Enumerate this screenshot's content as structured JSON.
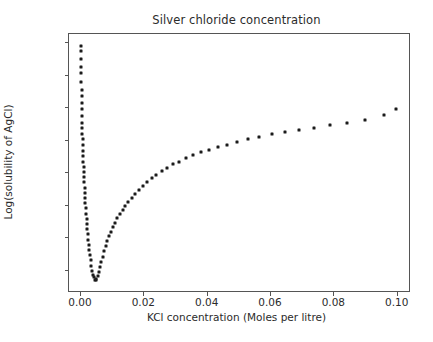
{
  "chart_data": {
    "type": "scatter",
    "title": "Silver chloride concentration",
    "xlabel": "KCl concentration (Moles per litre)",
    "ylabel": "Log(solubility of AgCl)",
    "xlim": [
      -0.0038,
      0.1042
    ],
    "ylim": [
      -6.92,
      -4.93
    ],
    "grid": false,
    "legend": null,
    "marker": {
      "shape": "square-dot",
      "size_px": 3,
      "color": "#1b1b1b"
    },
    "xticks": [
      0.0,
      0.02,
      0.04,
      0.06,
      0.08,
      0.1
    ],
    "xtick_labels": [
      "0.00",
      "0.02",
      "0.04",
      "0.06",
      "0.08",
      "0.10"
    ],
    "yticks": [
      -5.0,
      -5.25,
      -5.5,
      -5.75,
      -6.0,
      -6.25,
      -6.5,
      -6.75
    ],
    "ytick_labels": [
      "−5.00",
      "−5.25",
      "−5.50",
      "−5.75",
      "−6.00",
      "−6.25",
      "−6.50",
      "−6.75"
    ],
    "series": [
      {
        "name": "AgCl solubility vs KCl",
        "x": [
          2e-05,
          4e-05,
          6e-05,
          8e-05,
          0.0001,
          0.00013,
          0.00016,
          0.00019,
          0.00022,
          0.00026,
          0.0003,
          0.00034,
          0.00038,
          0.00043,
          0.00048,
          0.00053,
          0.00059,
          0.00065,
          0.00071,
          0.00078,
          0.00085,
          0.00093,
          0.00101,
          0.0011,
          0.00119,
          0.00129,
          0.00139,
          0.0015,
          0.00162,
          0.00174,
          0.00187,
          0.00201,
          0.00216,
          0.00232,
          0.00249,
          0.00267,
          0.00286,
          0.00306,
          0.00327,
          0.0035,
          0.00374,
          0.004,
          0.00428,
          0.00457,
          0.00488,
          0.00521,
          0.00557,
          0.00595,
          0.00635,
          0.00678,
          0.00724,
          0.00773,
          0.00826,
          0.00882,
          0.00942,
          0.01006,
          0.01075,
          0.01148,
          0.01226,
          0.0131,
          0.014,
          0.01496,
          0.01598,
          0.01707,
          0.01824,
          0.01949,
          0.02083,
          0.02226,
          0.02378,
          0.02541,
          0.02715,
          0.02901,
          0.031,
          0.03313,
          0.0354,
          0.03783,
          0.04042,
          0.04319,
          0.04615,
          0.04932,
          0.0527,
          0.05632,
          0.06018,
          0.06431,
          0.06872,
          0.07343,
          0.07847,
          0.08385,
          0.0896,
          0.09575,
          0.0995
        ],
        "y": [
          -5.02,
          -5.06,
          -5.12,
          -5.18,
          -5.23,
          -5.3,
          -5.36,
          -5.41,
          -5.46,
          -5.51,
          -5.56,
          -5.61,
          -5.65,
          -5.7,
          -5.74,
          -5.78,
          -5.83,
          -5.87,
          -5.91,
          -5.95,
          -5.99,
          -6.03,
          -6.07,
          -6.11,
          -6.15,
          -6.19,
          -6.23,
          -6.27,
          -6.31,
          -6.35,
          -6.39,
          -6.43,
          -6.47,
          -6.51,
          -6.55,
          -6.59,
          -6.63,
          -6.67,
          -6.71,
          -6.75,
          -6.78,
          -6.8,
          -6.82,
          -6.82,
          -6.81,
          -6.79,
          -6.76,
          -6.72,
          -6.68,
          -6.64,
          -6.6,
          -6.56,
          -6.52,
          -6.48,
          -6.45,
          -6.41,
          -6.38,
          -6.34,
          -6.31,
          -6.28,
          -6.25,
          -6.22,
          -6.19,
          -6.16,
          -6.13,
          -6.1,
          -6.07,
          -6.04,
          -6.01,
          -5.98,
          -5.96,
          -5.93,
          -5.91,
          -5.88,
          -5.86,
          -5.84,
          -5.82,
          -5.8,
          -5.78,
          -5.76,
          -5.74,
          -5.72,
          -5.7,
          -5.68,
          -5.67,
          -5.65,
          -5.63,
          -5.61,
          -5.59,
          -5.55,
          -5.51
        ]
      }
    ]
  }
}
